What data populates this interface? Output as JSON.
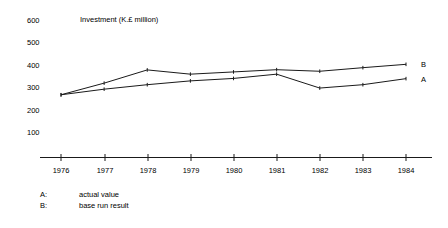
{
  "chart_data": {
    "type": "line",
    "title": "Investment  (K.£  million)",
    "xlabel": "",
    "ylabel": "",
    "grid": false,
    "legend_position": "below-left",
    "x": [
      "1976",
      "1977",
      "1978",
      "1979",
      "1980",
      "1981",
      "1982",
      "1983",
      "1984"
    ],
    "categories": [
      "1976",
      "1977",
      "1978",
      "1979",
      "1980",
      "1981",
      "1982",
      "1983",
      "1984"
    ],
    "xlim": [
      "1976",
      "1984"
    ],
    "ylim": [
      0,
      600
    ],
    "ytick_labels": [
      "600",
      "500",
      "400",
      "300",
      "200",
      "100"
    ],
    "yticks": [
      600,
      500,
      400,
      300,
      200,
      100
    ],
    "series": [
      {
        "name": "A",
        "label": "actual value",
        "end_marker": "A",
        "values": [
          280,
          305,
          325,
          342,
          353,
          372,
          310,
          325,
          352
        ]
      },
      {
        "name": "B",
        "label": "base run result",
        "end_marker": "B",
        "values": [
          280,
          332,
          391,
          372,
          382,
          392,
          385,
          401,
          416
        ]
      }
    ],
    "annotations": []
  },
  "legend": {
    "entries": [
      {
        "key": "A:",
        "text": "actual value"
      },
      {
        "key": "B:",
        "text": "base run result"
      }
    ]
  },
  "colors": {
    "line": "#1a1a1a",
    "axis": "#1a1a1a",
    "text": "#000000",
    "background": "#ffffff"
  }
}
